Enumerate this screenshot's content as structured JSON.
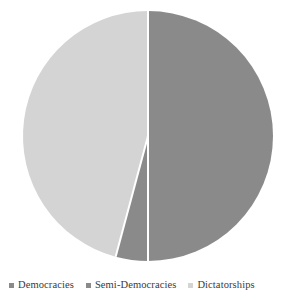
{
  "chart_data": {
    "type": "pie",
    "title": "",
    "subtitle": "",
    "xlabel": "",
    "ylabel": "",
    "grid": false,
    "legend_position": "bottom",
    "categories": [
      "Democracies",
      "Semi-Democracies",
      "Dictatorships"
    ],
    "values": [
      50,
      4,
      46
    ],
    "units": "percent",
    "slices": [
      {
        "label": "Democracies",
        "value": 50,
        "color": "#8a8a8a",
        "start_angle_deg": 0,
        "end_angle_deg": 180
      },
      {
        "label": "Semi-Democracies",
        "value": 4,
        "color": "#8a8a8a",
        "start_angle_deg": 180,
        "end_angle_deg": 195
      },
      {
        "label": "Dictatorships",
        "value": 46,
        "color": "#d4d4d4",
        "start_angle_deg": 195,
        "end_angle_deg": 360
      }
    ],
    "geometry": {
      "center_x": 148,
      "center_y": 136,
      "radius": 125,
      "separator_color": "#ffffff",
      "separator_width": 2
    }
  },
  "legend": {
    "items": [
      {
        "label": "Democracies",
        "color": "#8a8a8a",
        "marker": "square-swatch"
      },
      {
        "label": "Semi-Democracies",
        "color": "#8a8a8a",
        "marker": "square-swatch"
      },
      {
        "label": "Dictatorships",
        "color": "#d4d4d4",
        "marker": "square-swatch"
      }
    ]
  },
  "colors": {
    "background": "#ffffff",
    "slice_dark": "#8a8a8a",
    "slice_light": "#d4d4d4",
    "separator": "#ffffff",
    "legend_text": "#3a3a3a"
  }
}
